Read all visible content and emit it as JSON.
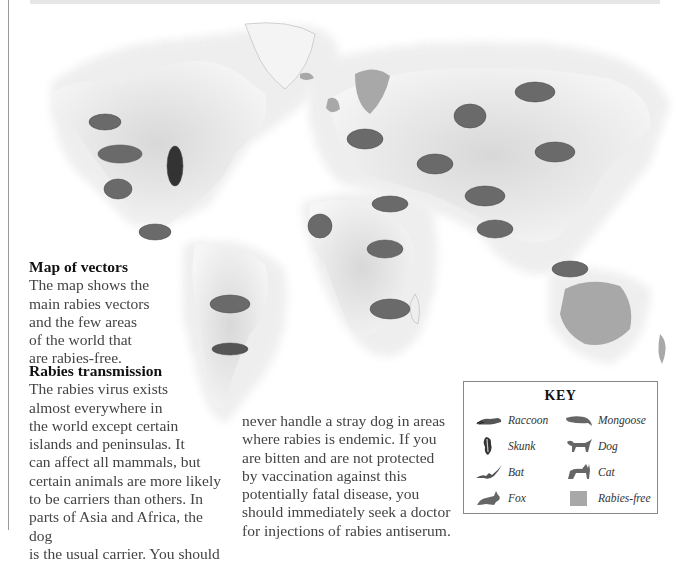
{
  "map": {
    "title": "World rabies vectors map",
    "rabies_free_regions": [
      "Australia",
      "Scandinavia",
      "British Isles",
      "Iceland"
    ],
    "animals_on_map": [
      {
        "animal": "Fox",
        "region": "Alaska"
      },
      {
        "animal": "Raccoon",
        "region": "Western North America"
      },
      {
        "animal": "Skunk",
        "region": "Eastern North America"
      },
      {
        "animal": "Cat",
        "region": "Western USA"
      },
      {
        "animal": "Fox",
        "region": "Mexico"
      },
      {
        "animal": "Dog",
        "region": "South America"
      },
      {
        "animal": "Bat",
        "region": "Southern South America"
      },
      {
        "animal": "Fox",
        "region": "Europe"
      },
      {
        "animal": "Cat",
        "region": "Russia"
      },
      {
        "animal": "Dog",
        "region": "Siberia"
      },
      {
        "animal": "Dog",
        "region": "Middle East"
      },
      {
        "animal": "Fox",
        "region": "East Asia"
      },
      {
        "animal": "Dog",
        "region": "Central Asia"
      },
      {
        "animal": "Bat",
        "region": "North Africa"
      },
      {
        "animal": "Cat",
        "region": "West Africa"
      },
      {
        "animal": "Dog",
        "region": "Central Africa"
      },
      {
        "animal": "Mongoose",
        "region": "Southern Africa"
      },
      {
        "animal": "Dog",
        "region": "India"
      },
      {
        "animal": "Dog",
        "region": "Southeast Asia"
      }
    ],
    "colors": {
      "land_hatch": "#8a8a8a",
      "rabies_free": "#a8a8a8",
      "background": "#ffffff"
    }
  },
  "vectors": {
    "heading": "Map of vectors",
    "body": "The map shows the\nmain rabies vectors\nand the few areas\nof the world that\nare rabies-free."
  },
  "transmission": {
    "heading": "Rabies transmission",
    "body_col1": "The rabies virus exists\nalmost everywhere in\nthe world except certain\nislands and peninsulas. It\ncan affect all mammals, but\ncertain animals are more likely\nto be carriers than others. In\nparts of Asia and Africa, the dog\nis the usual carrier. You should",
    "body_col2": "never handle a stray dog in areas\nwhere rabies is endemic. If you\nare bitten and are not protected\nby vaccination against this\npotentially fatal disease, you\nshould immediately seek a doctor\nfor injections of rabies antiserum."
  },
  "key": {
    "title": "KEY",
    "items": [
      {
        "label": "Raccoon",
        "icon": "raccoon-icon"
      },
      {
        "label": "Mongoose",
        "icon": "mongoose-icon"
      },
      {
        "label": "Skunk",
        "icon": "skunk-icon"
      },
      {
        "label": "Dog",
        "icon": "dog-icon"
      },
      {
        "label": "Bat",
        "icon": "bat-icon"
      },
      {
        "label": "Cat",
        "icon": "cat-icon"
      },
      {
        "label": "Fox",
        "icon": "fox-icon"
      },
      {
        "label": "Rabies-free",
        "icon": "rabies-free-swatch"
      }
    ]
  }
}
